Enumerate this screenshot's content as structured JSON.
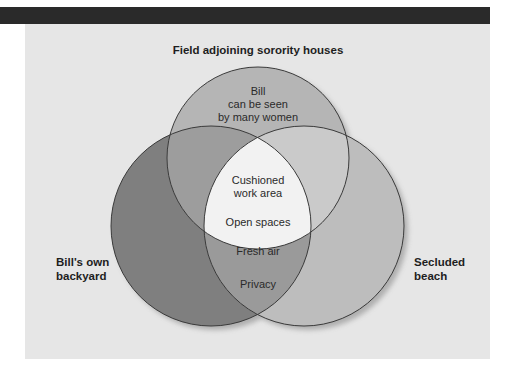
{
  "diagram": {
    "type": "venn",
    "title": "Field adjoining sorority houses",
    "sets": [
      {
        "id": "top",
        "label": "Field adjoining sorority houses",
        "color": "#b5b5b5"
      },
      {
        "id": "left",
        "label_line1": "Bill's own",
        "label_line2": "backyard",
        "color": "#7f7f7f"
      },
      {
        "id": "right",
        "label_line1": "Secluded",
        "label_line2": "beach",
        "color": "#bdbdbd"
      }
    ],
    "regions": {
      "top_only": {
        "line1": "Bill",
        "line2": "can be seen",
        "line3": "by many women",
        "color": "#b5b5b5"
      },
      "center": {
        "item1_line1": "Cushioned",
        "item1_line2": "work area",
        "item2": "Open spaces",
        "item3": "Fresh air",
        "color": "#f2f2f2"
      },
      "left_right": {
        "text": "Privacy",
        "color": "#9a9a9a"
      },
      "top_left": {
        "color": "#9d9d9d"
      },
      "top_right": {
        "color": "#cacaca"
      }
    }
  },
  "colors": {
    "header_bar": "#2a2a2a",
    "panel_background": "#e6e6e6",
    "outline": "#3a3a3a"
  }
}
